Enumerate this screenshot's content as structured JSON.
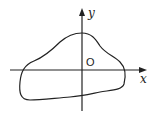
{
  "diagram": {
    "type": "closed-curve-on-axes",
    "axes": {
      "x_label": "x",
      "y_label": "y",
      "origin_label": "O"
    },
    "colors": {
      "stroke": "#222222",
      "background": "#ffffff"
    }
  }
}
